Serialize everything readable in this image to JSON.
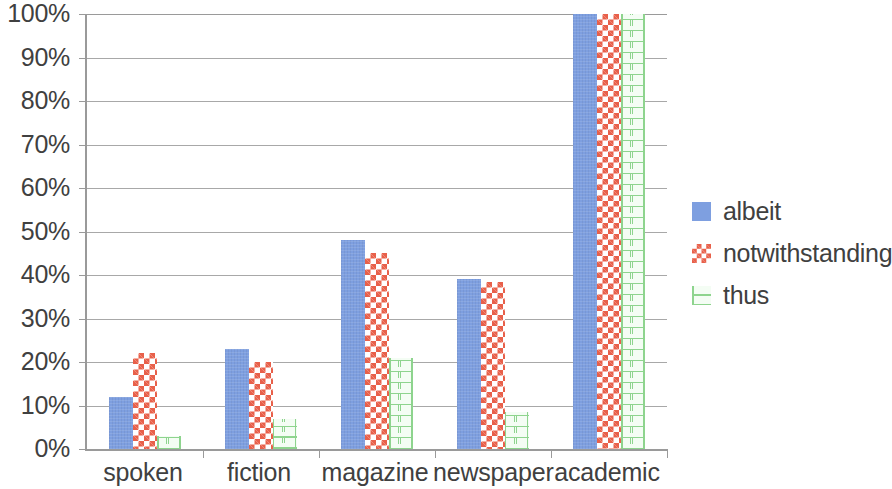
{
  "chart_data": {
    "type": "bar",
    "title": "",
    "subtitle": "",
    "xlabel": "",
    "ylabel": "",
    "grid": true,
    "legend_position": "right",
    "ylim": [
      0,
      100
    ],
    "y_tick_labels": [
      "100%",
      "90%",
      "80%",
      "70%",
      "60%",
      "50%",
      "40%",
      "30%",
      "20%",
      "10%",
      "0%"
    ],
    "y_tick_values": [
      100,
      90,
      80,
      70,
      60,
      50,
      40,
      30,
      20,
      10,
      0
    ],
    "categories": [
      "spoken",
      "fiction",
      "magazine",
      "newspaper",
      "academic"
    ],
    "series": [
      {
        "name": "albeit",
        "color": "#7e9fe0",
        "pattern": "solid",
        "values": [
          12,
          23,
          48,
          39,
          100
        ]
      },
      {
        "name": "notwithstanding",
        "color": "#e8604a",
        "pattern": "checkerboard",
        "values": [
          22,
          20,
          45,
          38.5,
          100
        ]
      },
      {
        "name": "thus",
        "color": "#8ed48e",
        "pattern": "brick",
        "values": [
          3,
          7,
          21,
          8.5,
          100
        ]
      }
    ]
  },
  "axis": {
    "axis_line_color": "#9a9a9a",
    "gridline_color": "#a8a8a8",
    "tick_label_color": "#404040"
  }
}
